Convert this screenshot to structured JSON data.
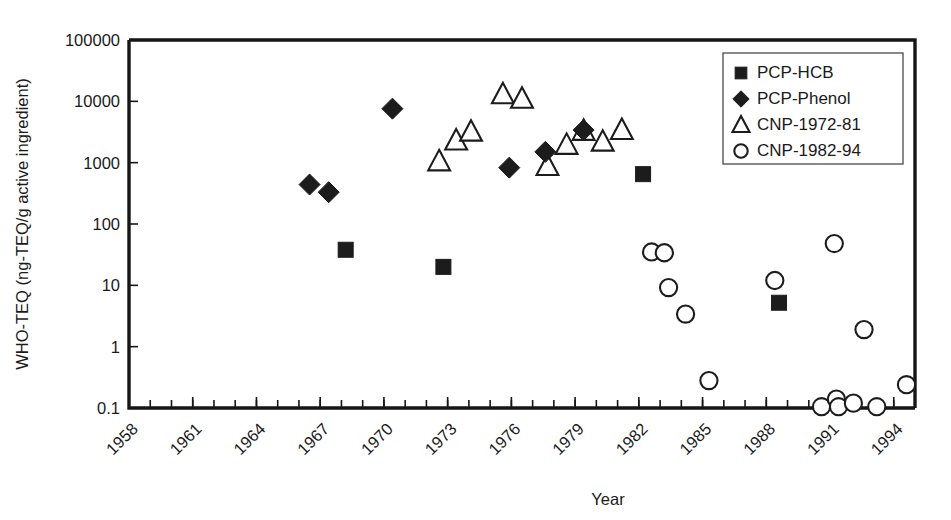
{
  "chart_data": {
    "type": "scatter",
    "title": "",
    "xlabel": "Year",
    "ylabel": "WHO-TEQ  (ng-TEQ/g  active ingredient)",
    "xlim": [
      1958,
      1995
    ],
    "ylim": [
      0.1,
      100000
    ],
    "yscale": "log",
    "grid": false,
    "legend_position": "top-right",
    "y_ticks": [
      "0.1",
      "1",
      "10",
      "100",
      "1000",
      "10000",
      "100000"
    ],
    "y_tick_values": [
      0.1,
      1,
      10,
      100,
      1000,
      10000,
      100000
    ],
    "x_ticks": [
      "1958",
      "1961",
      "1964",
      "1967",
      "1970",
      "1973",
      "1976",
      "1979",
      "1982",
      "1985",
      "1988",
      "1991",
      "1994"
    ],
    "x_tick_values": [
      1958,
      1961,
      1964,
      1967,
      1970,
      1973,
      1976,
      1979,
      1982,
      1985,
      1988,
      1991,
      1994
    ],
    "x_minor_tick_step": 1,
    "series": [
      {
        "name": "PCP-HCB",
        "marker": "filled-square",
        "points": [
          {
            "x": 1968.2,
            "y": 38
          },
          {
            "x": 1972.8,
            "y": 20
          },
          {
            "x": 1982.2,
            "y": 650
          },
          {
            "x": 1988.6,
            "y": 5.2
          }
        ]
      },
      {
        "name": "PCP-Phenol",
        "marker": "filled-diamond",
        "points": [
          {
            "x": 1966.5,
            "y": 440
          },
          {
            "x": 1967.4,
            "y": 330
          },
          {
            "x": 1970.4,
            "y": 7600
          },
          {
            "x": 1975.9,
            "y": 830
          },
          {
            "x": 1977.6,
            "y": 1500
          },
          {
            "x": 1979.4,
            "y": 3400
          }
        ]
      },
      {
        "name": "CNP-1972-81",
        "marker": "open-triangle",
        "points": [
          {
            "x": 1972.6,
            "y": 1050
          },
          {
            "x": 1973.4,
            "y": 2300
          },
          {
            "x": 1974.1,
            "y": 3200
          },
          {
            "x": 1975.6,
            "y": 13000
          },
          {
            "x": 1976.5,
            "y": 11000
          },
          {
            "x": 1977.7,
            "y": 880
          },
          {
            "x": 1978.6,
            "y": 1950
          },
          {
            "x": 1979.4,
            "y": 3300
          },
          {
            "x": 1980.3,
            "y": 2200
          },
          {
            "x": 1981.2,
            "y": 3400
          }
        ]
      },
      {
        "name": "CNP-1982-94",
        "marker": "open-circle",
        "points": [
          {
            "x": 1982.6,
            "y": 35
          },
          {
            "x": 1983.2,
            "y": 34
          },
          {
            "x": 1983.4,
            "y": 9.2
          },
          {
            "x": 1984.2,
            "y": 3.4
          },
          {
            "x": 1985.3,
            "y": 0.28
          },
          {
            "x": 1988.4,
            "y": 12
          },
          {
            "x": 1990.6,
            "y": 0.105
          },
          {
            "x": 1991.2,
            "y": 48
          },
          {
            "x": 1991.3,
            "y": 0.14
          },
          {
            "x": 1991.4,
            "y": 0.105
          },
          {
            "x": 1992.1,
            "y": 0.12
          },
          {
            "x": 1992.6,
            "y": 1.9
          },
          {
            "x": 1993.2,
            "y": 0.105
          },
          {
            "x": 1994.6,
            "y": 0.24
          }
        ]
      }
    ]
  },
  "legend": {
    "items": [
      {
        "label": "PCP-HCB",
        "marker": "filled-square"
      },
      {
        "label": "PCP-Phenol",
        "marker": "filled-diamond"
      },
      {
        "label": "CNP-1972-81",
        "marker": "open-triangle"
      },
      {
        "label": "CNP-1982-94",
        "marker": "open-circle"
      }
    ]
  },
  "colors": {
    "marker": "#1c1c1c",
    "axis": "#161616",
    "background": "#ffffff"
  }
}
